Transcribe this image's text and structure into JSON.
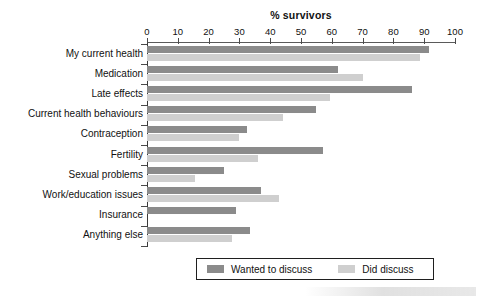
{
  "chart_data": {
    "type": "bar",
    "orientation": "horizontal",
    "title": "% survivors",
    "xlabel": "% survivors",
    "ylabel": "",
    "xlim": [
      0,
      100
    ],
    "xticks": [
      0,
      10,
      20,
      30,
      40,
      50,
      60,
      70,
      80,
      90,
      100
    ],
    "xtick_labels": [
      "0",
      "10",
      "20",
      "30",
      "40",
      "50",
      "60",
      "70",
      "80",
      "90",
      "100"
    ],
    "grid": false,
    "legend_position": "bottom",
    "categories": [
      "My current health",
      "Medication",
      "Late effects",
      "Current health behaviours",
      "Contraception",
      "Fertility",
      "Sexual problems",
      "Work/education issues",
      "Insurance",
      "Anything else"
    ],
    "series": [
      {
        "name": "Wanted to discuss",
        "color": "#8b8b8b",
        "values": [
          91.5,
          62,
          86,
          55,
          32.5,
          57,
          25,
          37,
          29,
          33.5
        ]
      },
      {
        "name": "Did discuss",
        "color": "#cfcfcf",
        "values": [
          88.5,
          70,
          59.5,
          44,
          30,
          36,
          15.5,
          43,
          0,
          27.5
        ]
      }
    ]
  },
  "legend": {
    "items": [
      {
        "label": "Wanted to discuss",
        "color": "#8b8b8b",
        "swatch_name": "legend-swatch-wanted"
      },
      {
        "label": "Did discuss",
        "color": "#cfcfcf",
        "swatch_name": "legend-swatch-did"
      }
    ]
  },
  "colors": {
    "wanted_to_discuss": "#8b8b8b",
    "did_discuss": "#cfcfcf",
    "axis": "#3a3a3a",
    "text": "#111111",
    "background": "#ffffff"
  }
}
